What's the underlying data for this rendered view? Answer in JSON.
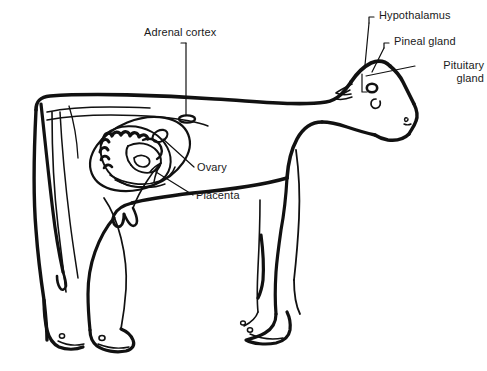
{
  "figure": {
    "type": "anatomical line diagram",
    "background_color": "#ffffff",
    "stroke_color": "#111111",
    "text_color": "#1a1a1a"
  },
  "labels": {
    "adrenal_cortex": "Adrenal cortex",
    "hypothalamus": "Hypothalamus",
    "pineal_gland": "Pineal gland",
    "pituitary_gland_line1": "Pituitary",
    "pituitary_gland_line2": "gland",
    "ovary": "Ovary",
    "placenta": "Placenta"
  },
  "annotations": [
    {
      "id": "adrenal-cortex",
      "text": "Adrenal cortex",
      "leader": "vertical line down to small ellipse marker"
    },
    {
      "id": "hypothalamus",
      "text": "Hypothalamus",
      "leader": "bracket elbow to head"
    },
    {
      "id": "pineal-gland",
      "text": "Pineal gland",
      "leader": "bracket elbow to head"
    },
    {
      "id": "pituitary-gland",
      "text": "Pituitary gland",
      "leader": "straight line to head"
    },
    {
      "id": "ovary",
      "text": "Ovary",
      "leader": "straight line to uterus"
    },
    {
      "id": "placenta",
      "text": "Placenta",
      "leader": "straight line to uterus"
    }
  ]
}
